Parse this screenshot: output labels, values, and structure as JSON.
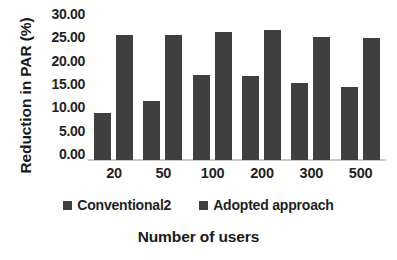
{
  "chart_data": {
    "type": "bar",
    "title": "",
    "xlabel": "Number of users",
    "ylabel": "Reduction in PAR (%)",
    "categories": [
      "20",
      "50",
      "100",
      "200",
      "300",
      "500"
    ],
    "series": [
      {
        "name": "Conventional2",
        "color": "#3f3f3f",
        "values": [
          10.0,
          12.7,
          18.2,
          18.0,
          16.5,
          15.6
        ]
      },
      {
        "name": "Adopted approach",
        "color": "#3f3f3f",
        "values": [
          26.8,
          26.8,
          27.4,
          27.8,
          26.3,
          26.2
        ]
      }
    ],
    "ylim": [
      0.0,
      30.0
    ],
    "ytick_step": 5.0,
    "ytick_labels": [
      "30.00",
      "25.00",
      "20.00",
      "15.00",
      "10.00",
      "5.00",
      "0.00"
    ],
    "ytick_values": [
      30.0,
      25.0,
      20.0,
      15.0,
      10.0,
      5.0,
      0.0
    ],
    "grid": false,
    "legend_position": "bottom",
    "axis_color": "#c9c9c9",
    "text_color": "#1f1f1f",
    "background": "#ffffff"
  }
}
